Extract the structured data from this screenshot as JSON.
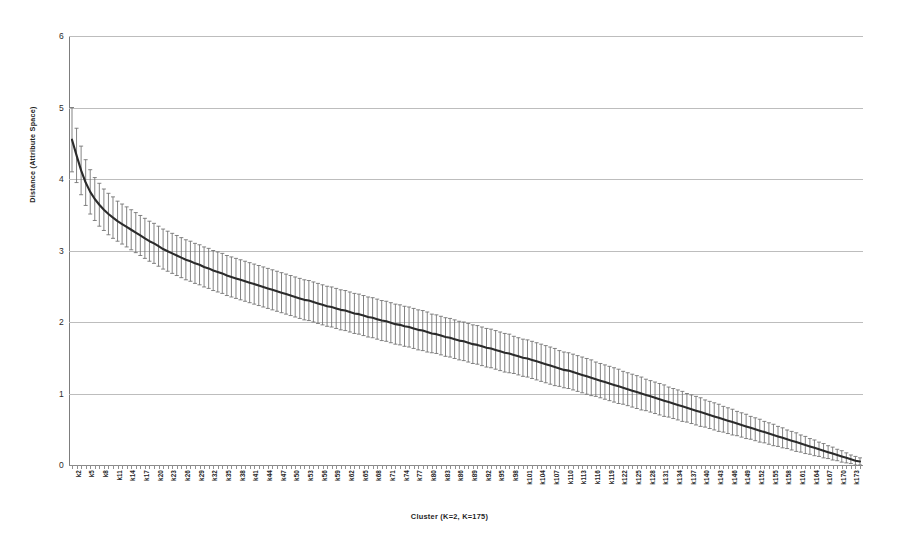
{
  "chart_data": {
    "type": "line",
    "title": "",
    "subtitle": "",
    "xlabel": "Cluster (K=2, K=175)",
    "ylabel": "Distance (Attribute Space)",
    "ylim": [
      0,
      6
    ],
    "ytick_labels": [
      "0",
      "1",
      "2",
      "3",
      "4",
      "5",
      "6"
    ],
    "ytick_values": [
      0,
      1,
      2,
      3,
      4,
      5,
      6
    ],
    "grid": true,
    "legend": "none",
    "error_bars": "symmetric vertical error bars with caps on every point",
    "xtick_labels": [
      "k2",
      "k5",
      "k8",
      "k11",
      "k14",
      "k17",
      "k20",
      "k23",
      "k26",
      "k29",
      "k32",
      "k35",
      "k38",
      "k41",
      "k44",
      "k47",
      "k50",
      "k53",
      "k56",
      "k59",
      "k62",
      "k65",
      "k68",
      "k71",
      "k74",
      "k77",
      "k80",
      "k83",
      "k86",
      "k89",
      "k92",
      "k95",
      "k98",
      "k101",
      "k104",
      "k107",
      "k110",
      "k113",
      "k116",
      "k119",
      "k122",
      "k125",
      "k128",
      "k131",
      "k134",
      "k137",
      "k140",
      "k143",
      "k146",
      "k149",
      "k152",
      "k155",
      "k158",
      "k161",
      "k164",
      "k167",
      "k170",
      "k173"
    ],
    "xtick_every": 3,
    "x_first_cluster": 2,
    "x_last_cluster": 175,
    "n_points": 174,
    "series": [
      {
        "name": "Mean distance",
        "x": [
          2,
          3,
          4,
          5,
          6,
          7,
          8,
          9,
          10,
          11,
          12,
          13,
          14,
          15,
          16,
          17,
          18,
          19,
          20,
          21,
          22,
          23,
          24,
          25,
          26,
          27,
          28,
          29,
          30,
          31,
          32,
          33,
          34,
          35,
          36,
          37,
          38,
          39,
          40,
          41,
          42,
          43,
          44,
          45,
          46,
          47,
          48,
          49,
          50,
          51,
          52,
          53,
          54,
          55,
          56,
          57,
          58,
          59,
          60,
          61,
          62,
          63,
          64,
          65,
          66,
          67,
          68,
          69,
          70,
          71,
          72,
          73,
          74,
          75,
          76,
          77,
          78,
          79,
          80,
          81,
          82,
          83,
          84,
          85,
          86,
          87,
          88,
          89,
          90,
          91,
          92,
          93,
          94,
          95,
          96,
          97,
          98,
          99,
          100,
          101,
          102,
          103,
          104,
          105,
          106,
          107,
          108,
          109,
          110,
          111,
          112,
          113,
          114,
          115,
          116,
          117,
          118,
          119,
          120,
          121,
          122,
          123,
          124,
          125,
          126,
          127,
          128,
          129,
          130,
          131,
          132,
          133,
          134,
          135,
          136,
          137,
          138,
          139,
          140,
          141,
          142,
          143,
          144,
          145,
          146,
          147,
          148,
          149,
          150,
          151,
          152,
          153,
          154,
          155,
          156,
          157,
          158,
          159,
          160,
          161,
          162,
          163,
          164,
          165,
          166,
          167,
          168,
          169,
          170,
          171,
          172,
          173,
          174,
          175
        ],
        "values": [
          4.55,
          4.33,
          4.12,
          3.95,
          3.82,
          3.72,
          3.64,
          3.57,
          3.51,
          3.46,
          3.41,
          3.37,
          3.33,
          3.29,
          3.25,
          3.21,
          3.17,
          3.13,
          3.1,
          3.06,
          3.02,
          2.99,
          2.96,
          2.93,
          2.9,
          2.87,
          2.85,
          2.82,
          2.8,
          2.77,
          2.75,
          2.72,
          2.7,
          2.68,
          2.65,
          2.63,
          2.61,
          2.59,
          2.57,
          2.55,
          2.53,
          2.51,
          2.49,
          2.47,
          2.45,
          2.43,
          2.41,
          2.39,
          2.37,
          2.35,
          2.33,
          2.31,
          2.3,
          2.28,
          2.26,
          2.24,
          2.22,
          2.21,
          2.19,
          2.17,
          2.16,
          2.14,
          2.12,
          2.11,
          2.09,
          2.07,
          2.06,
          2.04,
          2.02,
          2.01,
          1.99,
          1.97,
          1.96,
          1.94,
          1.93,
          1.91,
          1.89,
          1.88,
          1.86,
          1.84,
          1.83,
          1.81,
          1.79,
          1.78,
          1.76,
          1.74,
          1.73,
          1.71,
          1.69,
          1.68,
          1.66,
          1.64,
          1.63,
          1.61,
          1.59,
          1.57,
          1.56,
          1.54,
          1.52,
          1.5,
          1.49,
          1.47,
          1.45,
          1.43,
          1.41,
          1.39,
          1.37,
          1.35,
          1.33,
          1.32,
          1.3,
          1.28,
          1.26,
          1.24,
          1.22,
          1.2,
          1.18,
          1.16,
          1.14,
          1.12,
          1.1,
          1.08,
          1.06,
          1.04,
          1.02,
          1.0,
          0.98,
          0.96,
          0.94,
          0.92,
          0.9,
          0.88,
          0.86,
          0.84,
          0.82,
          0.8,
          0.78,
          0.76,
          0.74,
          0.72,
          0.7,
          0.68,
          0.66,
          0.64,
          0.62,
          0.6,
          0.58,
          0.56,
          0.54,
          0.52,
          0.5,
          0.48,
          0.46,
          0.44,
          0.42,
          0.4,
          0.38,
          0.36,
          0.34,
          0.32,
          0.3,
          0.28,
          0.26,
          0.24,
          0.22,
          0.2,
          0.18,
          0.16,
          0.14,
          0.12,
          0.1,
          0.08,
          0.06,
          0.05
        ],
        "errors": [
          0.45,
          0.38,
          0.34,
          0.32,
          0.31,
          0.3,
          0.3,
          0.29,
          0.29,
          0.29,
          0.28,
          0.28,
          0.28,
          0.28,
          0.28,
          0.28,
          0.28,
          0.28,
          0.28,
          0.28,
          0.28,
          0.28,
          0.28,
          0.28,
          0.28,
          0.28,
          0.28,
          0.28,
          0.28,
          0.28,
          0.28,
          0.28,
          0.28,
          0.28,
          0.28,
          0.28,
          0.28,
          0.28,
          0.28,
          0.28,
          0.28,
          0.28,
          0.28,
          0.28,
          0.28,
          0.28,
          0.28,
          0.28,
          0.28,
          0.28,
          0.28,
          0.28,
          0.28,
          0.28,
          0.28,
          0.28,
          0.28,
          0.28,
          0.28,
          0.28,
          0.28,
          0.28,
          0.28,
          0.28,
          0.28,
          0.28,
          0.28,
          0.28,
          0.28,
          0.28,
          0.28,
          0.28,
          0.28,
          0.28,
          0.28,
          0.28,
          0.28,
          0.28,
          0.28,
          0.27,
          0.27,
          0.27,
          0.27,
          0.27,
          0.27,
          0.27,
          0.27,
          0.27,
          0.27,
          0.27,
          0.27,
          0.27,
          0.27,
          0.27,
          0.27,
          0.27,
          0.27,
          0.26,
          0.26,
          0.26,
          0.26,
          0.26,
          0.26,
          0.26,
          0.26,
          0.26,
          0.26,
          0.25,
          0.25,
          0.25,
          0.25,
          0.25,
          0.25,
          0.25,
          0.25,
          0.24,
          0.24,
          0.24,
          0.24,
          0.24,
          0.24,
          0.23,
          0.23,
          0.23,
          0.23,
          0.23,
          0.22,
          0.22,
          0.22,
          0.22,
          0.22,
          0.21,
          0.21,
          0.21,
          0.21,
          0.2,
          0.2,
          0.2,
          0.2,
          0.19,
          0.19,
          0.19,
          0.19,
          0.18,
          0.18,
          0.18,
          0.17,
          0.17,
          0.17,
          0.16,
          0.16,
          0.16,
          0.15,
          0.15,
          0.15,
          0.14,
          0.14,
          0.13,
          0.13,
          0.13,
          0.12,
          0.12,
          0.11,
          0.11,
          0.1,
          0.1,
          0.09,
          0.09,
          0.08,
          0.08,
          0.07,
          0.06,
          0.06,
          0.05,
          0.04
        ]
      }
    ],
    "colors": {
      "line": "#2b2b2b",
      "error_bar": "#6e6e6e",
      "grid": "#bdbdbd",
      "axis": "#7d7d7d",
      "background": "#ffffff"
    }
  }
}
